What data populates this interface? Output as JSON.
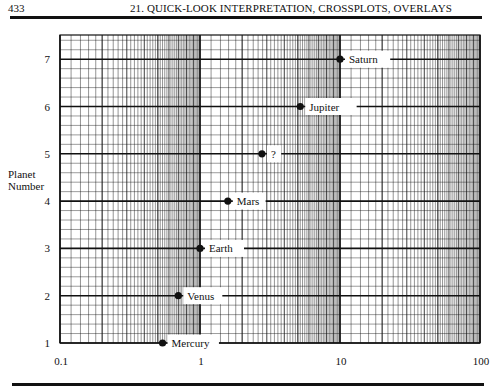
{
  "header": {
    "page_number": "433",
    "running_title": "21. QUICK-LOOK INTERPRETATION, CROSSPLOTS, OVERLAYS"
  },
  "axes": {
    "ylabel_line1": "Planet",
    "ylabel_line2": "Number"
  },
  "colors": {
    "ink": "#111111",
    "background": "#ffffff"
  },
  "chart_data": {
    "type": "scatter",
    "title": "",
    "xlabel": "",
    "ylabel": "Planet Number",
    "xscale": "log",
    "xlim": [
      0.1,
      100
    ],
    "ylim": [
      1,
      7.5
    ],
    "x_ticks": [
      "0.1",
      "1",
      "10",
      "100"
    ],
    "y_ticks": [
      "1",
      "2",
      "3",
      "4",
      "5",
      "6",
      "7"
    ],
    "grid": true,
    "legend": null,
    "points": [
      {
        "label": "Mercury",
        "x": 0.54,
        "y": 1
      },
      {
        "label": "Venus",
        "x": 0.7,
        "y": 2
      },
      {
        "label": "Earth",
        "x": 1.0,
        "y": 3
      },
      {
        "label": "Mars",
        "x": 1.58,
        "y": 4
      },
      {
        "label": "?",
        "x": 2.77,
        "y": 5
      },
      {
        "label": "Jupiter",
        "x": 5.2,
        "y": 6
      },
      {
        "label": "Saturn",
        "x": 10.0,
        "y": 7
      }
    ]
  }
}
